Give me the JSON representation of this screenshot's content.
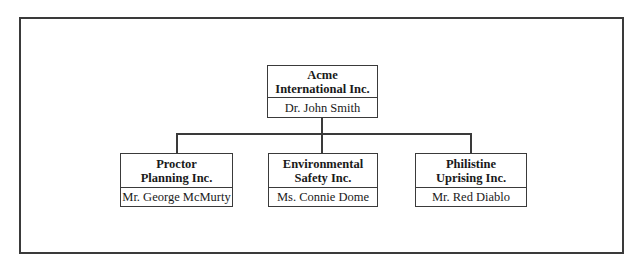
{
  "chart": {
    "root": {
      "org_line1": "Acme",
      "org_line2": "International Inc.",
      "person": "Dr. John Smith"
    },
    "children": [
      {
        "org_line1": "Proctor",
        "org_line2": "Planning Inc.",
        "person": "Mr. George McMurty"
      },
      {
        "org_line1": "Environmental",
        "org_line2": "Safety Inc.",
        "person": "Ms. Connie Dome"
      },
      {
        "org_line1": "Philistine",
        "org_line2": "Uprising Inc.",
        "person": "Mr. Red Diablo"
      }
    ]
  },
  "colors": {
    "line": "#3a3a3a",
    "background": "#ffffff",
    "text": "#1a1a1a"
  }
}
